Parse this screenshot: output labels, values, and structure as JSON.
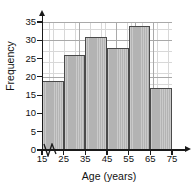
{
  "chart_data": {
    "type": "bar",
    "title": "",
    "subtitle": "",
    "xlabel": "Age (years)",
    "ylabel": "Frequency",
    "categories": [
      "15-25",
      "25-35",
      "35-45",
      "45-55",
      "55-65",
      "65-75"
    ],
    "bin_edges": [
      15,
      25,
      35,
      45,
      55,
      65,
      75
    ],
    "values": [
      19,
      26,
      31,
      28,
      34,
      17
    ],
    "xlim": [
      15,
      75
    ],
    "ylim": [
      0,
      35
    ],
    "x_ticks": [
      "15",
      "25",
      "35",
      "45",
      "55",
      "65",
      "75"
    ],
    "y_ticks": [
      "0",
      "5",
      "10",
      "15",
      "20",
      "25",
      "30",
      "35"
    ],
    "grid": "on",
    "legend": "none",
    "axis_break": "x-axis break between 0 and 15",
    "bar_fill_color": "#b3b3b3",
    "bar_border_color": "#4a4a4a",
    "grid_minor_color": "#d8d8d8",
    "grid_major_color": "#a9a9a9",
    "axis_color": "#1a1a1a"
  }
}
